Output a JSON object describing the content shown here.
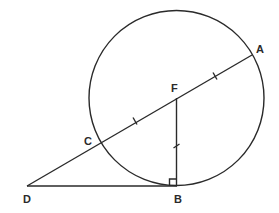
{
  "diagram": {
    "title": "",
    "circle": {
      "center": "F",
      "cx": 176.5,
      "cy": 98,
      "r": 87.5
    },
    "points": {
      "A": {
        "label": "A",
        "x": 252,
        "y": 55
      },
      "B": {
        "label": "B",
        "x": 177,
        "y": 185.5
      },
      "C": {
        "label": "C",
        "x": 101,
        "y": 142
      },
      "D": {
        "label": "D",
        "x": 27,
        "y": 186
      },
      "F": {
        "label": "F",
        "x": 176.5,
        "y": 98
      }
    },
    "segments": [
      {
        "from": "D",
        "to": "A",
        "note": "secant through C and F"
      },
      {
        "from": "D",
        "to": "B",
        "note": "tangent at B"
      },
      {
        "from": "F",
        "to": "B",
        "note": "radius"
      }
    ],
    "tick_marks": [
      {
        "segment": "CF",
        "x": 135,
        "y": 121
      },
      {
        "segment": "FA",
        "x": 215,
        "y": 76
      },
      {
        "segment": "FB",
        "x": 177,
        "y": 146
      }
    ],
    "right_angle": {
      "at": "B",
      "size": 7
    },
    "colors": {
      "ink": "#2a2a2a",
      "background": "#ffffff"
    }
  }
}
